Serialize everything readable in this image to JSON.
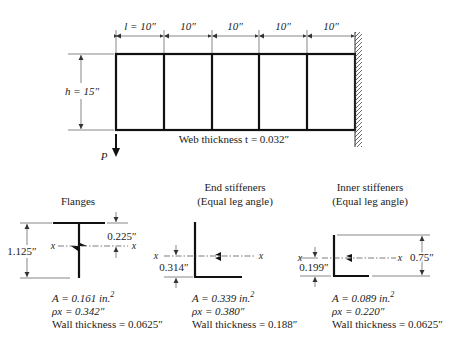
{
  "beam": {
    "panel_labels": [
      "l = 10″",
      "10″",
      "10″",
      "10″",
      "10″"
    ],
    "height_label": "h = 15″",
    "web_thickness_label": "Web thickness t = 0.032″",
    "load_label": "P"
  },
  "sections": {
    "flanges": {
      "title": "Flanges",
      "depth_label": "1.125″",
      "offset_label": "0.225″",
      "axis_label": "x",
      "area": "A = 0.161 in.",
      "area_exp": "2",
      "rho": "ρx = 0.342″",
      "wall": "Wall thickness = 0.0625″"
    },
    "end_stiffeners": {
      "title": "End stiffeners",
      "subtitle": "(Equal leg angle)",
      "offset_label": "0.314″",
      "axis_label": "x",
      "area": "A = 0.339 in.",
      "area_exp": "2",
      "rho": "ρx = 0.380″",
      "wall": "Wall thickness = 0.188″"
    },
    "inner_stiffeners": {
      "title": "Inner stiffeners",
      "subtitle": "(Equal leg angle)",
      "offset_label": "0.199″",
      "leg_label": "0.75″",
      "axis_label": "x",
      "area": "A = 0.089 in.",
      "area_exp": "2",
      "rho": "ρx = 0.220″",
      "wall": "Wall thickness = 0.0625″"
    }
  }
}
